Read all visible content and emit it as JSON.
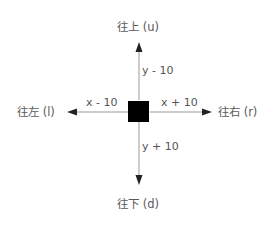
{
  "diagram": {
    "directions": {
      "up": "往上 (u)",
      "down": "往下 (d)",
      "left": "往左 (l)",
      "right": "往右 (r)"
    },
    "deltas": {
      "up": "y - 10",
      "down": "y + 10",
      "left": "x - 10",
      "right": "x + 10"
    },
    "colors": {
      "square": "#000000",
      "line": "#999999",
      "arrowhead": "#222222",
      "text": "#555555"
    }
  }
}
